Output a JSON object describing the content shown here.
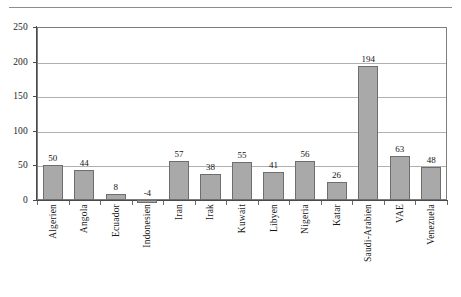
{
  "chart_data": {
    "type": "bar",
    "title": "",
    "xlabel": "",
    "ylabel": "",
    "ylim": [
      0,
      250
    ],
    "ytick_values": [
      0,
      50,
      100,
      150,
      200,
      250
    ],
    "ytick_labels": [
      "0",
      "50",
      "100",
      "150",
      "200",
      "250"
    ],
    "grid": true,
    "grid_axis": "y",
    "legend": false,
    "bar_color": "#a9a9a9",
    "bar_edge_color": "#6e6e6e",
    "gridline_color": "#b0b0b0",
    "axis_color": "#4a4a4a",
    "show_value_labels": true,
    "categories": [
      "Algerien",
      "Angola",
      "Ecuador",
      "Indonesien",
      "Iran",
      "Irak",
      "Kuwait",
      "Libyen",
      "Nigeria",
      "Katar",
      "Saudi-Arabien",
      "VAE",
      "Venezuela"
    ],
    "values": [
      50,
      44,
      8,
      -4,
      57,
      38,
      55,
      41,
      56,
      26,
      194,
      63,
      48
    ],
    "value_labels": [
      "50",
      "44",
      "8",
      "-4",
      "57",
      "38",
      "55",
      "41",
      "56",
      "26",
      "194",
      "63",
      "48"
    ]
  }
}
